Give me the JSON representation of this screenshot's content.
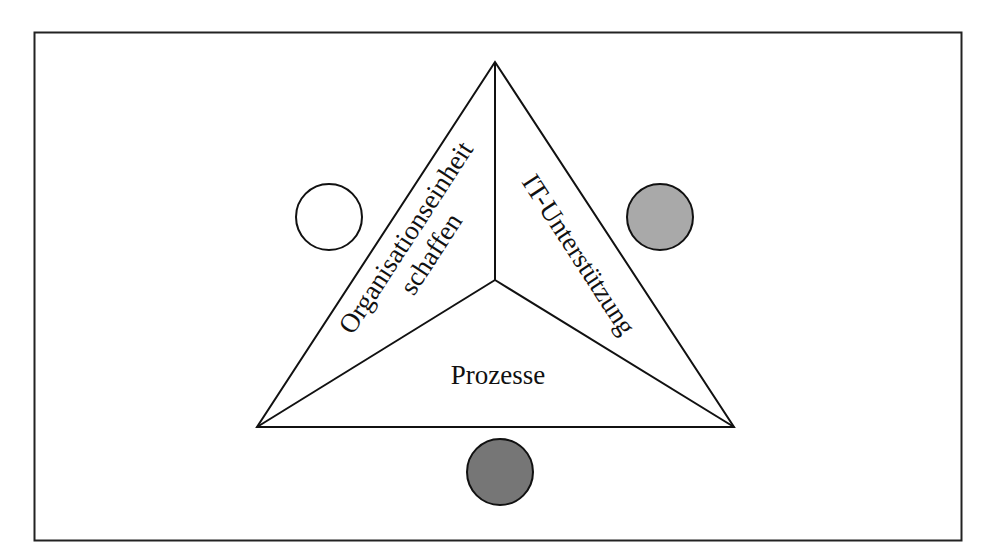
{
  "diagram": {
    "labels": {
      "left_line1": "Organisationseinheit",
      "left_line2": "schaffen",
      "right": "IT-Unterstützung",
      "bottom": "Prozesse"
    },
    "circles": {
      "left": {
        "fill": "#ffffff",
        "meaning": "white-circle"
      },
      "right": {
        "fill": "#a9a9a9",
        "meaning": "light-gray-circle"
      },
      "bottom": {
        "fill": "#767676",
        "meaning": "dark-gray-circle"
      }
    },
    "colors": {
      "stroke": "#111111",
      "background": "#ffffff"
    }
  }
}
